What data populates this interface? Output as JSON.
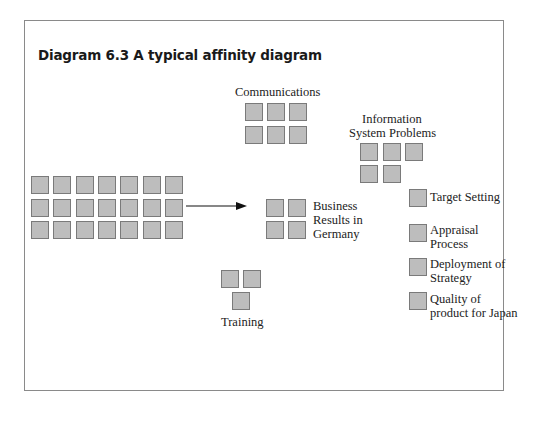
{
  "figure": {
    "title": "Diagram 6.3 A typical affinity diagram",
    "colors": {
      "card_fill": "#bdbdbd",
      "card_border": "#7a7a7a",
      "frame": "#8a8a8a",
      "arrow": "#111111"
    }
  },
  "unsorted_cards": {
    "rows": 3,
    "cols": 7,
    "count": 21
  },
  "groups": [
    {
      "id": "communications",
      "label": "Communications",
      "cards": 6
    },
    {
      "id": "information-system-problems",
      "label_lines": [
        "Information",
        "System Problems"
      ],
      "cards": 5
    },
    {
      "id": "business-results-germany",
      "label_lines": [
        "Business",
        "Results in",
        "Germany"
      ],
      "cards": 4
    },
    {
      "id": "training",
      "label": "Training",
      "cards": 3
    },
    {
      "id": "target-setting",
      "label": "Target Setting",
      "cards": 1
    },
    {
      "id": "appraisal-process",
      "label_lines": [
        "Appraisal",
        "Process"
      ],
      "cards": 1
    },
    {
      "id": "deployment-of-strategy",
      "label_lines": [
        "Deployment of",
        "Strategy"
      ],
      "cards": 1
    },
    {
      "id": "quality-of-product-japan",
      "label_lines": [
        "Quality of",
        "product for Japan"
      ],
      "cards": 1
    }
  ]
}
